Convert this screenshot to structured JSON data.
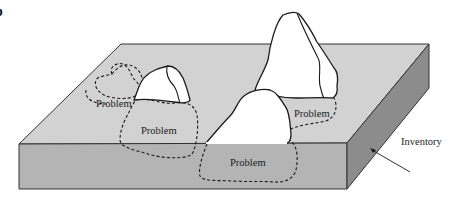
{
  "figure": {
    "panel_letter": "b",
    "labels": {
      "problem_1": "Problem",
      "problem_2": "Problem",
      "problem_3": "Problem",
      "problem_4": "Problem",
      "inventory": "Inventory"
    },
    "colors": {
      "top_face": "#d2d2d2",
      "front_face": "#b4b4b4",
      "side_face": "#8c8c8c",
      "rock_fill": "#ffffff",
      "outline": "#1a1a1a"
    }
  }
}
